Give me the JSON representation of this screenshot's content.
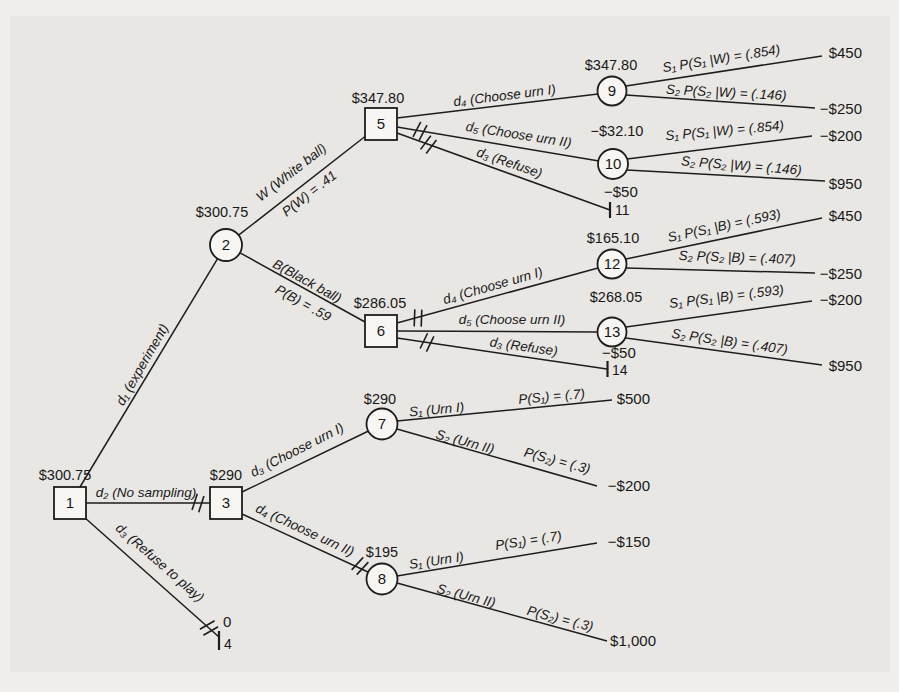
{
  "tree": {
    "colors": {
      "background": "#e9e7e3",
      "line": "#1d1d1d",
      "text": "#181818",
      "node_fill": "#f7f6f3"
    },
    "nodes": {
      "n1": {
        "num": "1",
        "value": "$300.75"
      },
      "n2": {
        "num": "2",
        "value": "$300.75"
      },
      "n3": {
        "num": "3",
        "value": "$290"
      },
      "n5": {
        "num": "5",
        "value": "$347.80"
      },
      "n6": {
        "num": "6",
        "value": "$286.05"
      },
      "n7": {
        "num": "7",
        "value": "$290"
      },
      "n8": {
        "num": "8",
        "value": "$195"
      },
      "n9": {
        "num": "9",
        "value": "$347.80"
      },
      "n10": {
        "num": "10",
        "value": "−$32.10"
      },
      "n12": {
        "num": "12",
        "value": "$165.10"
      },
      "n13": {
        "num": "13",
        "value": "$268.05"
      }
    },
    "terminals": {
      "t4": {
        "payoff": "0",
        "num": "4"
      },
      "t11": {
        "payoff": "−$50",
        "num": "11"
      },
      "t14": {
        "payoff": "−$50",
        "num": "14"
      }
    },
    "branches": {
      "d1": "d₁ (experiment)",
      "d2": "d₂ (No sampling)",
      "d3_play": "d₃ (Refuse to play)",
      "w": "W (White ball)",
      "w_p": "P(W) = .41",
      "b": "B(Black ball)",
      "b_p": "P(B) = .59",
      "n5_d4": "d₄ (Choose urn I)",
      "n5_d5": "d₅ (Choose urn II)",
      "n5_d3": "d₃ (Refuse)",
      "n6_d4": "d₄ (Choose urn I)",
      "n6_d5": "d₅ (Choose urn II)",
      "n6_d3": "d₃ (Refuse)",
      "n3_d3": "d₃ (Choose urn I)",
      "n3_d4": "d₄ (Choose urn II)",
      "n9_s1": "S₁ P(S₁ |W) = (.854)",
      "n9_s2": "S₂ P(S₂ |W) = (.146)",
      "n10_s1": "S₁ P(S₁ |W) = (.854)",
      "n10_s2": "S₂ P(S₂ |W) = (.146)",
      "n12_s1": "S₁ P(S₁ |B) = (.593)",
      "n12_s2": "S₂ P(S₂ |B) = (.407)",
      "n13_s1": "S₁ P(S₁ |B) = (.593)",
      "n13_s2": "S₂ P(S₂ |B) = (.407)",
      "n7_s1": "S₁ (Urn I)",
      "n7_p1": "P(S₁) = (.7)",
      "n7_s2": "S₂ (Urn II)",
      "n7_p2": "P(S₂) = (.3)",
      "n8_s1": "S₁ (Urn I)",
      "n8_p1": "P(S₁) = (.7)",
      "n8_s2": "S₂ (Urn II)",
      "n8_p2": "P(S₂) = (.3)"
    },
    "payoffs": {
      "w_s1": "$450",
      "w_s2": "−$250",
      "w2_s1": "−$200",
      "w2_s2": "$950",
      "b_s1": "$450",
      "b_s2": "−$250",
      "b2_s1": "−$200",
      "b2_s2": "$950",
      "no_s1": "$500",
      "no_s2": "−$200",
      "no2_s1": "−$150",
      "no2_s2": "$1,000"
    }
  }
}
